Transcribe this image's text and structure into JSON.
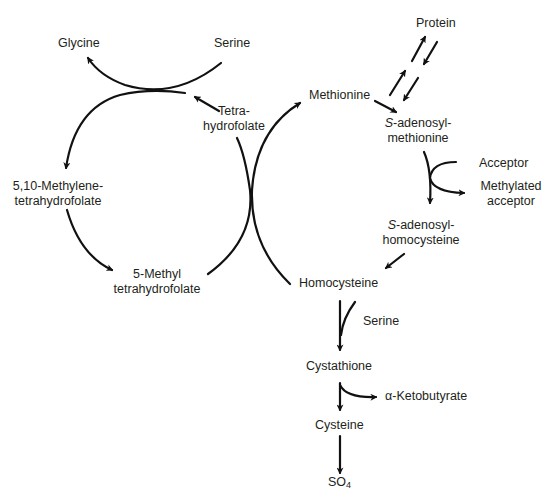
{
  "diagram": {
    "type": "metabolic-pathway",
    "nodes": {
      "glycine": "Glycine",
      "serine_top": "Serine",
      "thf_line1": "Tetra-",
      "thf_line2": "hydrofolate",
      "methylene_thf_line1": "5,10-Methylene-",
      "methylene_thf_line2": "tetrahydrofolate",
      "methyl_thf_line1": "5-Methyl",
      "methyl_thf_line2": "tetrahydrofolate",
      "methionine": "Methionine",
      "protein": "Protein",
      "sam_prefix": "S",
      "sam_line1_rest": "-adenosyl-",
      "sam_line2": "methionine",
      "acceptor": "Acceptor",
      "methylated_acceptor_line1": "Methylated",
      "methylated_acceptor_line2": "acceptor",
      "sah_prefix": "S",
      "sah_line1_rest": "-adenosyl-",
      "sah_line2": "homocysteine",
      "homocysteine": "Homocysteine",
      "serine_lower": "Serine",
      "cystathione": "Cystathione",
      "ketobutyrate": "α-Ketobutyrate",
      "cysteine": "Cysteine",
      "sulfate_base": "SO",
      "sulfate_sub": "4"
    },
    "edges": [
      {
        "from": "Serine",
        "to": "Glycine"
      },
      {
        "from": "Tetrahydrofolate",
        "to": "5,10-Methylenetetrahydrofolate"
      },
      {
        "from": "5,10-Methylenetetrahydrofolate",
        "to": "5-Methyl tetrahydrofolate"
      },
      {
        "from": "5-Methyl tetrahydrofolate",
        "to": "Tetrahydrofolate"
      },
      {
        "from": "Homocysteine",
        "to": "Methionine"
      },
      {
        "from": "Methionine",
        "to": "S-adenosylmethionine"
      },
      {
        "from": "S-adenosylmethionine",
        "to": "Protein",
        "reversible": true
      },
      {
        "from": "S-adenosylmethionine",
        "to": "S-adenosylhomocysteine",
        "cosubstrate": "Acceptor",
        "coproduct": "Methylated acceptor"
      },
      {
        "from": "S-adenosylhomocysteine",
        "to": "Homocysteine"
      },
      {
        "from": "Homocysteine",
        "to": "Cystathione",
        "cosubstrate": "Serine"
      },
      {
        "from": "Cystathione",
        "to": "Cysteine",
        "coproduct": "α-Ketobutyrate"
      },
      {
        "from": "Cysteine",
        "to": "SO4"
      }
    ]
  }
}
